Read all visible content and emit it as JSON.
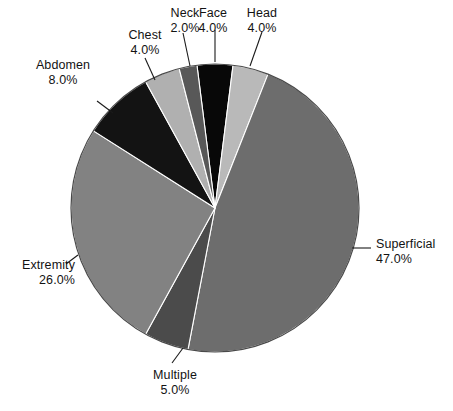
{
  "chart_data": {
    "type": "pie",
    "title": "",
    "subtitle": "",
    "xlabel": "",
    "ylabel": "",
    "legend_position": "none",
    "grid": false,
    "units": "percent",
    "total": 100.0,
    "categories": [
      "Superficial",
      "Extremity",
      "Abdomen",
      "Multiple",
      "Head",
      "Face",
      "Chest",
      "Neck"
    ],
    "values": [
      47.0,
      26.0,
      8.0,
      5.0,
      4.0,
      4.0,
      4.0,
      2.0
    ],
    "start_angle_deg": -7.2,
    "direction": "clockwise",
    "slices": [
      {
        "id": "face",
        "label": "Face",
        "value_label": "4.0%",
        "value": 4.0,
        "color": "#080808",
        "start_deg": -7.2,
        "end_deg": 7.2,
        "label_x": 176,
        "label_y": 6,
        "label_align": "center",
        "leader": "M 215,62 L 215,30"
      },
      {
        "id": "head",
        "label": "Head",
        "value_label": "4.0%",
        "value": 4.0,
        "color": "#b9b9b9",
        "start_deg": 7.2,
        "end_deg": 21.6,
        "label_x": 225,
        "label_y": 6,
        "label_align": "center",
        "leader": "M 250,66 L 262,32"
      },
      {
        "id": "superficial",
        "label": "Superficial",
        "value_label": "47.0%",
        "value": 47.0,
        "color": "#6d6d6d",
        "start_deg": 21.6,
        "end_deg": 190.8,
        "label_x": 376,
        "label_y": 237,
        "label_align": "left",
        "leader": "M 352,248 L 371,248"
      },
      {
        "id": "multiple",
        "label": "Multiple",
        "value_label": "5.0%",
        "value": 5.0,
        "color": "#4b4b4b",
        "start_deg": 190.8,
        "end_deg": 208.8,
        "label_x": 138,
        "label_y": 368,
        "label_align": "center",
        "leader": "M 183,348 L 172,363"
      },
      {
        "id": "extremity",
        "label": "Extremity",
        "value_label": "26.0%",
        "value": 26.0,
        "color": "#828282",
        "start_deg": 208.8,
        "end_deg": 302.4,
        "label_x": 3,
        "label_y": 258,
        "label_align": "right",
        "leader": "M 78,255 L 66,264"
      },
      {
        "id": "abdomen",
        "label": "Abdomen",
        "value_label": "8.0%",
        "value": 8.0,
        "color": "#131313",
        "start_deg": 302.4,
        "end_deg": 331.2,
        "label_x": 26,
        "label_y": 58,
        "label_align": "center",
        "leader": "M 113,113 L 97,101"
      },
      {
        "id": "chest",
        "label": "Chest",
        "value_label": "4.0%",
        "value": 4.0,
        "color": "#b0b0b0",
        "start_deg": 331.2,
        "end_deg": 345.6,
        "label_x": 108,
        "label_y": 28,
        "label_align": "center",
        "leader": "M 155,80 L 145,58"
      },
      {
        "id": "neck",
        "label": "Neck",
        "value_label": "2.0%",
        "value": 2.0,
        "color": "#585858",
        "start_deg": 345.6,
        "end_deg": -7.2,
        "label_x": 148,
        "label_y": 6,
        "label_align": "center",
        "leader": "M 190,66 L 183,33"
      }
    ],
    "geometry": {
      "center_x": 215,
      "center_y": 208,
      "radius": 144,
      "outline_color": "#4a4a4a"
    }
  }
}
